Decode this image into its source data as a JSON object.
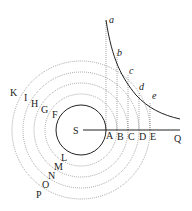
{
  "diagram": {
    "center_label": "S",
    "axis_end_label": "Q",
    "axis_point_labels": [
      "A",
      "B",
      "C",
      "D",
      "E"
    ],
    "curve_labels": [
      "a",
      "b",
      "c",
      "d",
      "e"
    ],
    "upper_left_labels": [
      "F",
      "G",
      "H",
      "I",
      "K"
    ],
    "lower_left_labels": [
      "L",
      "M",
      "N",
      "O",
      "P"
    ]
  },
  "colors": {
    "ink": "#222222",
    "dotted": "#666666",
    "background": "#ffffff"
  }
}
